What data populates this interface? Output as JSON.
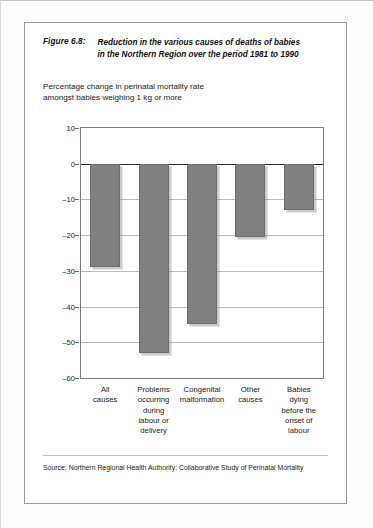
{
  "figure": {
    "label": "Figure 6.8:",
    "title_line1": "Reduction in the various causes of deaths of babies",
    "title_line2": "in the Northern Region over the period 1981 to 1990",
    "subtitle_line1": "Percentage change in perinatal mortality rate",
    "subtitle_line2": "amongst babies weighing 1 kg or more",
    "source": "Source: Northern Regional Health Authority: Collaborative Study of Perinatal Mortality"
  },
  "chart_data": {
    "type": "bar",
    "title": "Reduction in the various causes of deaths of babies in the Northern Region over the period 1981 to 1990",
    "subtitle": "Percentage change in perinatal mortality rate amongst babies weighing 1 kg or more",
    "xlabel": "",
    "ylabel": "",
    "ylim": [
      -60,
      10
    ],
    "ytick_step": 10,
    "grid": true,
    "legend": "none",
    "bar_color": "#808080",
    "categories": [
      "All causes",
      "Problems occurring during labour or delivery",
      "Congenital malformation",
      "Other causes",
      "Babies dying before the onset of labour"
    ],
    "category_lines": [
      [
        "All",
        "causes"
      ],
      [
        "Problems",
        "occurring",
        "during",
        "labour or",
        "delivery"
      ],
      [
        "Congenital",
        "malformation"
      ],
      [
        "Other",
        "causes"
      ],
      [
        "Babies",
        "dying",
        "before the",
        "onset of",
        "labour"
      ]
    ],
    "values": [
      -29,
      -53,
      -45,
      -20.5,
      -13
    ],
    "yticks": [
      10,
      0,
      -10,
      -20,
      -30,
      -40,
      -50,
      -60
    ],
    "ytick_labels": [
      "10",
      "0",
      "–10",
      "–20",
      "–30",
      "–40",
      "–50",
      "–60"
    ]
  }
}
